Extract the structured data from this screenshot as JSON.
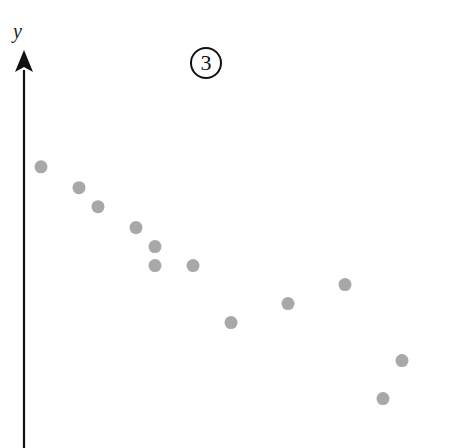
{
  "figure": {
    "badge": "3",
    "y_axis_label": "y",
    "point_color": "#a8a8a8",
    "axis_color": "#111111"
  },
  "chart_data": {
    "type": "scatter",
    "title": "",
    "badge": "3",
    "xlabel": "",
    "ylabel": "y",
    "grid": false,
    "legend": null,
    "xlim": [
      0,
      23
    ],
    "ylim": [
      0,
      22
    ],
    "points": [
      {
        "x": 1,
        "y": 14.8
      },
      {
        "x": 3,
        "y": 13.7
      },
      {
        "x": 4,
        "y": 12.7
      },
      {
        "x": 6,
        "y": 11.6
      },
      {
        "x": 7,
        "y": 10.6
      },
      {
        "x": 7,
        "y": 9.6
      },
      {
        "x": 9,
        "y": 9.6
      },
      {
        "x": 11,
        "y": 6.6
      },
      {
        "x": 14,
        "y": 7.6
      },
      {
        "x": 17,
        "y": 8.6
      },
      {
        "x": 19,
        "y": 2.6
      },
      {
        "x": 20,
        "y": 4.6
      }
    ]
  }
}
